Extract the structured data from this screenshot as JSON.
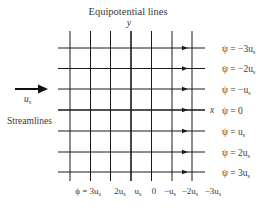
{
  "title": "Equipotential lines",
  "y_axis_label": "y",
  "x_axis_label": "x",
  "side_label": "Streamlines",
  "flow_arrow_label": "u",
  "flow_arrow_subscript": "s",
  "streamlines": [
    {
      "psi_label": "ψ = −3u",
      "sub": "s"
    },
    {
      "psi_label": "ψ = −2u",
      "sub": "s"
    },
    {
      "psi_label": "ψ = −u",
      "sub": "s"
    },
    {
      "psi_label": "ψ = 0",
      "sub": ""
    },
    {
      "psi_label": "ψ = u",
      "sub": "s"
    },
    {
      "psi_label": "ψ = 2u",
      "sub": "s"
    },
    {
      "psi_label": "ψ = 3u",
      "sub": "s"
    }
  ],
  "equipotentials": [
    {
      "phi_label": "ϕ = 3u",
      "sub": "s"
    },
    {
      "phi_label": "2u",
      "sub": "s"
    },
    {
      "phi_label": "u",
      "sub": "s"
    },
    {
      "phi_label": "0",
      "sub": ""
    },
    {
      "phi_label": "−u",
      "sub": "s"
    },
    {
      "phi_label": "−2u",
      "sub": "s"
    },
    {
      "phi_label": "−3u",
      "sub": "s"
    }
  ],
  "colors": {
    "line": "#1a1a1a",
    "text": "#3a3a3a"
  }
}
